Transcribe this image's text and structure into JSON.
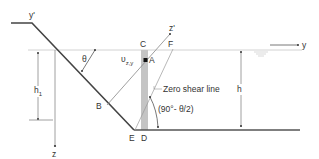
{
  "diagram": {
    "labels": {
      "y_prime": "y'",
      "z_prime": "z'",
      "y_axis": "y",
      "z_axis": "z",
      "theta": "θ",
      "h1_base": "h",
      "h1_sub": "1",
      "h": "h",
      "point_A": "A",
      "point_B": "B",
      "point_C": "C",
      "point_D": "D",
      "point_E": "E",
      "point_F": "F",
      "u_base": "υ",
      "u_sub": "z,y",
      "zero_shear": "Zero shear line",
      "angle": "(90°- θ/2)"
    },
    "colors": {
      "outline": "#444444",
      "thin_line": "#777777",
      "water_surface": "#cfcfcf",
      "shaded_band": "#c4c4c4"
    }
  }
}
